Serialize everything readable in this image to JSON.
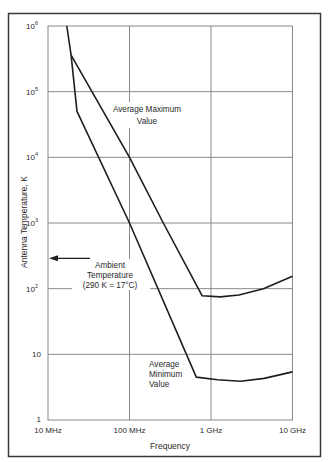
{
  "chart_data": {
    "type": "line",
    "title": "",
    "xlabel": "Frequency",
    "ylabel": "Antenna Temperature, K",
    "xscale": "log",
    "yscale": "log",
    "xlim_hz": [
      10000000,
      10000000000
    ],
    "ylim": [
      1,
      1000000
    ],
    "grid": true,
    "legend": "none (inline annotations)",
    "x_ticks": [
      {
        "value": 10000000,
        "label": "10 MHz"
      },
      {
        "value": 100000000,
        "label": "100 MHz"
      },
      {
        "value": 1000000000,
        "label": "1 GHz"
      },
      {
        "value": 10000000000,
        "label": "10 GHz"
      }
    ],
    "y_ticks": [
      {
        "value": 1,
        "label": "1",
        "base": "1",
        "exp": ""
      },
      {
        "value": 10,
        "label": "10",
        "base": "10",
        "exp": ""
      },
      {
        "value": 100,
        "label": "10^2",
        "base": "10",
        "exp": "2"
      },
      {
        "value": 1000,
        "label": "10^3",
        "base": "10",
        "exp": "3"
      },
      {
        "value": 10000,
        "label": "10^4",
        "base": "10",
        "exp": "4"
      },
      {
        "value": 100000,
        "label": "10^5",
        "base": "10",
        "exp": "5"
      },
      {
        "value": 1000000,
        "label": "10^6",
        "base": "10",
        "exp": "6"
      }
    ],
    "series": [
      {
        "name": "Average Maximum Value",
        "label_lines": [
          "Average Maximum",
          "Value"
        ],
        "points": [
          {
            "f_hz": 17000000,
            "T_K": 1000000
          },
          {
            "f_hz": 19200000,
            "T_K": 360000
          },
          {
            "f_hz": 100000000,
            "T_K": 10000
          },
          {
            "f_hz": 260000000,
            "T_K": 1000
          },
          {
            "f_hz": 780000000,
            "T_K": 78
          },
          {
            "f_hz": 1300000000,
            "T_K": 75
          },
          {
            "f_hz": 2200000000,
            "T_K": 80
          },
          {
            "f_hz": 4400000000,
            "T_K": 100
          },
          {
            "f_hz": 10000000000,
            "T_K": 155
          }
        ]
      },
      {
        "name": "Average Minimum Value",
        "label_lines": [
          "Average",
          "Minimum",
          "Value"
        ],
        "points": [
          {
            "f_hz": 19200000,
            "T_K": 360000
          },
          {
            "f_hz": 22700000,
            "T_K": 50000
          },
          {
            "f_hz": 100000000,
            "T_K": 1000
          },
          {
            "f_hz": 660000000,
            "T_K": 4.5
          },
          {
            "f_hz": 1200000000,
            "T_K": 4.1
          },
          {
            "f_hz": 2300000000,
            "T_K": 3.9
          },
          {
            "f_hz": 4500000000,
            "T_K": 4.3
          },
          {
            "f_hz": 10000000000,
            "T_K": 5.4
          }
        ]
      }
    ],
    "annotations": [
      {
        "type": "arrow",
        "label_lines": [
          "Ambient",
          "Temperature",
          "(290 K = 17°C)"
        ],
        "T_K": 290,
        "points_to": "y-axis"
      }
    ]
  },
  "labels": {
    "xlabel": "Frequency",
    "ylabel": "Antenna Temperature, K",
    "max_line1": "Average Maximum",
    "max_line2": "Value",
    "min_line1": "Average",
    "min_line2": "Minimum",
    "min_line3": "Value",
    "ambient_line1": "Ambient",
    "ambient_line2": "Temperature",
    "ambient_line3": "(290 K = 17°C)"
  },
  "colors": {
    "frame": "#3a3a3a",
    "grid": "#8a8a8a",
    "curve": "#1e1e1e",
    "text": "#2a2a2a",
    "background": "#ffffff"
  }
}
